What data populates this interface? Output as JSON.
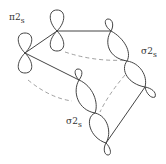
{
  "diagram": {
    "labels": {
      "pi": {
        "symbol": "π",
        "number": "2",
        "sub": "s"
      },
      "sigma_right": {
        "symbol": "σ",
        "number": "2",
        "sub": "s"
      },
      "sigma_bottom": {
        "symbol": "σ",
        "number": "2",
        "sub": "s"
      }
    },
    "colors": {
      "line": "#444444",
      "dashed": "#888888",
      "background": "#ffffff"
    }
  }
}
